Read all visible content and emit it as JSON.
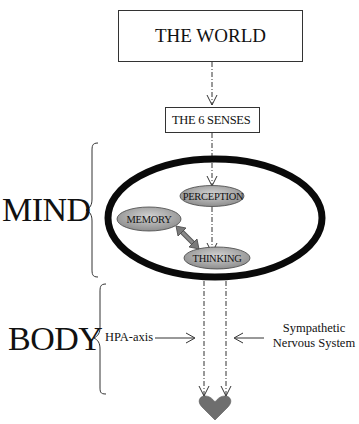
{
  "diagram": {
    "world_box": {
      "label": "THE WORLD"
    },
    "senses_box": {
      "label": "THE 6 SENSES"
    },
    "mind_ellipse": {
      "nodes": [
        {
          "id": "perception",
          "label": "PERCEPTION"
        },
        {
          "id": "memory",
          "label": "MEMORY"
        },
        {
          "id": "thinking",
          "label": "THINKING"
        }
      ]
    },
    "side_labels": {
      "mind": "MIND",
      "body": "BODY"
    },
    "body_labels": {
      "hpa": "HPA-axis",
      "sympathetic_line1": "Sympathetic",
      "sympathetic_line2": "Nervous System"
    },
    "target": {
      "icon": "heart-icon"
    },
    "colors": {
      "node_fill_light": "#bdbdbd",
      "node_fill_dark": "#8e8e8e",
      "ellipse_stroke": "#0a0a0a",
      "heart": "#6e6e6e",
      "double_arrow": "#7a7a7a",
      "line": "#333333"
    }
  }
}
